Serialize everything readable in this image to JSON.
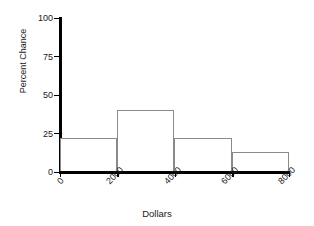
{
  "chart_data": {
    "type": "bar",
    "title": "",
    "subtitle": "",
    "xlabel": "Dollars",
    "ylabel": "Percent Chance",
    "categories": [
      "0-2000",
      "2000-4000",
      "4000-6000",
      "6000-8000"
    ],
    "bin_edges": [
      0,
      2000,
      4000,
      6000,
      8000
    ],
    "values": [
      22,
      40,
      22,
      13
    ],
    "xlim": [
      0,
      8000
    ],
    "ylim": [
      0,
      100
    ],
    "xticks": [
      "0",
      "2000",
      "4000",
      "6000",
      "8000"
    ],
    "yticks": [
      "0",
      "25",
      "50",
      "75",
      "100"
    ],
    "ytick_values": [
      0,
      25,
      50,
      75,
      100
    ],
    "grid": false,
    "legend": false,
    "bar_edge_color": "#8a8a8a",
    "bar_fill_color": "#ffffff",
    "axis_color": "#000000"
  }
}
